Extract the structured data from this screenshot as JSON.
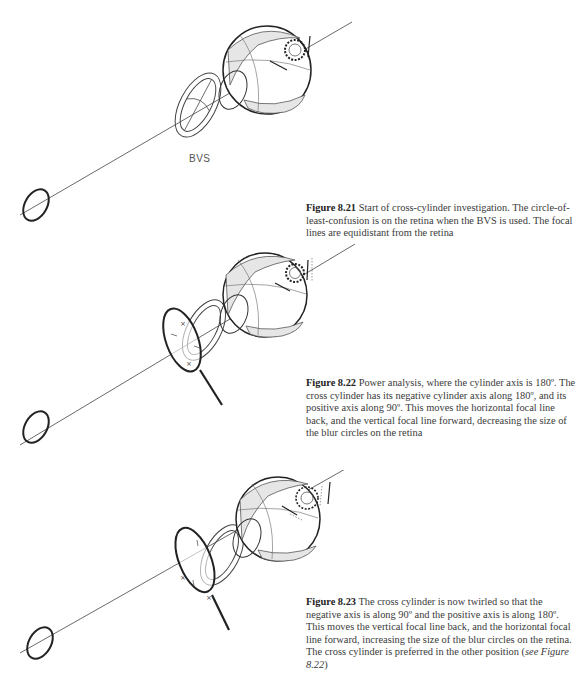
{
  "figures": [
    {
      "id": "figure-8-21",
      "label": "Figure 8.21",
      "caption": "Start of cross-cylinder investigation. The circle-of-least-confusion is on the retina when the BVS is used. The focal lines are equidistant from the retina",
      "annotation": "BVS"
    },
    {
      "id": "figure-8-22",
      "label": "Figure 8.22",
      "caption": "Power analysis, where the cylinder axis is 180º. The cross cylinder has its negative cylinder axis along 180º, and its positive axis along 90º. This moves the horizontal focal line back, and the vertical focal line forward, decreasing the size of the blur circles on the retina"
    },
    {
      "id": "figure-8-23",
      "label": "Figure 8.23",
      "caption_pre": "The cross cylinder is now twirled so that the negative axis is along 90º and the positive axis is along 180º. This moves the vertical focal line back, and the horizontal focal line forward, increasing the size of the blur circles on the retina. The cross cylinder is preferred in the other position (",
      "caption_ref": "see Figure 8.22",
      "caption_post": ")"
    }
  ],
  "colors": {
    "shade": "#e6e6e6",
    "line": "#333333",
    "text": "#3a3a3a"
  }
}
